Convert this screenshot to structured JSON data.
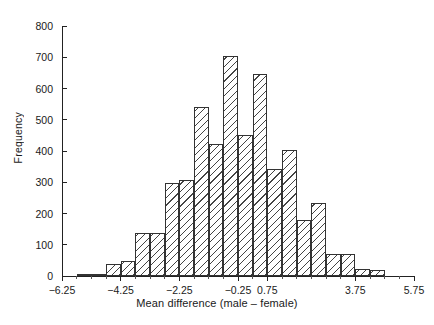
{
  "chart_data": {
    "type": "bar",
    "title": "",
    "xlabel": "Mean difference (male – female)",
    "ylabel": "Frequency",
    "xlim": [
      -6.25,
      5.75
    ],
    "ylim": [
      0,
      800
    ],
    "grid": false,
    "legend": null,
    "bin_width": 0.5,
    "x_tick_labels": [
      "-6.25",
      "-4.25",
      "-2.25",
      "-0.25",
      "0.75",
      "3.75",
      "5.75"
    ],
    "x_tick_values": [
      -6.25,
      -4.25,
      -2.25,
      -0.25,
      0.75,
      3.75,
      5.75
    ],
    "y_tick_labels": [
      "0",
      "100",
      "200",
      "300",
      "400",
      "500",
      "600",
      "700",
      "800"
    ],
    "y_tick_values": [
      0,
      100,
      200,
      300,
      400,
      500,
      600,
      700,
      800
    ],
    "bin_edges": [
      -6.25,
      -5.75,
      -5.25,
      -4.75,
      -4.25,
      -3.75,
      -3.25,
      -2.75,
      -2.25,
      -1.75,
      -1.25,
      -0.75,
      -0.25,
      0.25,
      0.75,
      1.25,
      1.75,
      2.25,
      2.75,
      3.25,
      3.75,
      4.25,
      4.75,
      5.25,
      5.75
    ],
    "bin_centers": [
      -6.0,
      -5.5,
      -5.0,
      -4.5,
      -4.0,
      -3.5,
      -3.0,
      -2.5,
      -2.0,
      -1.5,
      -1.0,
      -0.5,
      0.0,
      0.5,
      1.0,
      1.5,
      2.0,
      2.5,
      3.0,
      3.5,
      4.0,
      4.5,
      5.0,
      5.5
    ],
    "values": [
      0,
      6,
      5,
      38,
      48,
      138,
      138,
      297,
      307,
      540,
      423,
      703,
      452,
      648,
      343,
      402,
      178,
      234,
      72,
      72,
      22,
      18,
      0,
      0
    ],
    "categories": [
      "-6.00",
      "-5.50",
      "-5.00",
      "-4.50",
      "-4.00",
      "-3.50",
      "-3.00",
      "-2.50",
      "-2.00",
      "-1.50",
      "-1.00",
      "-0.50",
      "0.00",
      "0.50",
      "1.00",
      "1.50",
      "2.00",
      "2.50",
      "3.00",
      "3.50",
      "4.00",
      "4.50",
      "5.00",
      "5.50"
    ]
  }
}
